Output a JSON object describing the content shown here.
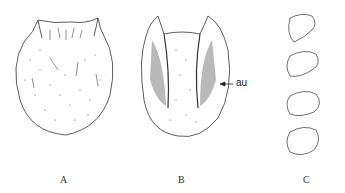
{
  "figure": {
    "panels": [
      {
        "id": "A",
        "label": "A",
        "description": "dorsal view of sclerite, dotted with setae"
      },
      {
        "id": "B",
        "label": "B",
        "description": "ventral view with shaded lateral areas",
        "annotation": "au"
      },
      {
        "id": "C",
        "label": "C",
        "description": "series of four lateral detail drawings"
      }
    ],
    "colors": {
      "ink": "#222222",
      "stipple": "#555555",
      "background": "#ffffff"
    }
  }
}
